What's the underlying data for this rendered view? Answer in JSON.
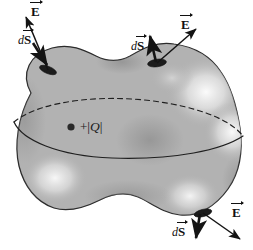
{
  "figure": {
    "background_color": "#ffffff",
    "surface": {
      "name": "gaussian-surface-blob",
      "fill_color": "#b2b2b2",
      "outline_color": "#2b2b2b",
      "highlight_color": "#f2f2f2",
      "shadow_color": "#8e8e8e"
    },
    "equator": {
      "dashed_label": "hidden-back-half",
      "solid_label": "visible-front-half",
      "color": "#1f1f1f"
    },
    "charge": {
      "dot_label": "point-charge-dot",
      "sign": "+",
      "magnitude_open": "|",
      "symbol": "Q",
      "magnitude_close": "|",
      "full_text": "+ |Q|"
    },
    "vectors": [
      {
        "id": "top-left",
        "field_label": "E",
        "area_label": "S",
        "area_prefix": "d",
        "field_direction": "up-left",
        "area_direction": "down-right"
      },
      {
        "id": "top-right",
        "field_label": "E",
        "area_label": "S",
        "area_prefix": "d",
        "field_direction": "up-right",
        "area_direction": "up"
      },
      {
        "id": "bottom-right",
        "field_label": "E",
        "area_label": "S",
        "area_prefix": "d",
        "field_direction": "down-right",
        "area_direction": "down"
      }
    ]
  }
}
